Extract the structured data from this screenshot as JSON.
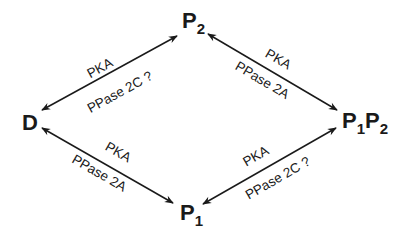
{
  "nodes": {
    "D": {
      "label": "D"
    },
    "P2": {
      "label": "P",
      "sub": "2"
    },
    "P1P2": {
      "label1": "P",
      "sub1": "1",
      "label2": "P",
      "sub2": "2"
    },
    "P1": {
      "label": "P",
      "sub": "1"
    }
  },
  "edges": [
    {
      "from": "D",
      "to": "P2",
      "top_label": "PKA",
      "bottom_label": "PPase 2C ?"
    },
    {
      "from": "P2",
      "to": "P1P2",
      "top_label": "PKA",
      "bottom_label": "PPase 2A"
    },
    {
      "from": "D",
      "to": "P1",
      "top_label": "PKA",
      "bottom_label": "PPase 2A"
    },
    {
      "from": "P1",
      "to": "P1P2",
      "top_label": "PKA",
      "bottom_label": "PPase 2C ?"
    }
  ],
  "colors": {
    "ink": "#1a1a1a",
    "background": "#ffffff"
  }
}
